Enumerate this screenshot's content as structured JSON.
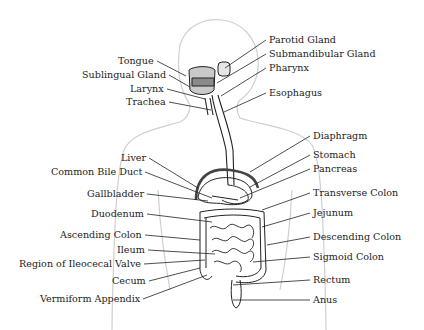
{
  "diagram": {
    "colors": {
      "outline": "#c8c8c8",
      "organ_stroke": "#222222",
      "diaphragm": "#444444",
      "label_text": "#222222",
      "leader": "#222222"
    },
    "labels_left": [
      {
        "id": "tongue",
        "text": "Tongue",
        "x": 118,
        "y": 61,
        "tx": 186,
        "ty": 76
      },
      {
        "id": "sublingual-gland",
        "text": "Sublingual Gland",
        "x": 82,
        "y": 75,
        "tx": 190,
        "ty": 87
      },
      {
        "id": "larynx",
        "text": "Larynx",
        "x": 130,
        "y": 89,
        "tx": 205,
        "ty": 99
      },
      {
        "id": "trachea",
        "text": "Trachea",
        "x": 126,
        "y": 102,
        "tx": 211,
        "ty": 110
      },
      {
        "id": "liver",
        "text": "Liver",
        "x": 121,
        "y": 158,
        "tx": 198,
        "ty": 188
      },
      {
        "id": "common-bile-duct",
        "text": "Common Bile Duct",
        "x": 51,
        "y": 172,
        "tx": 212,
        "ty": 198
      },
      {
        "id": "gallbladder",
        "text": "Gallbladder",
        "x": 87,
        "y": 194,
        "tx": 208,
        "ty": 201
      },
      {
        "id": "duodenum",
        "text": "Duodenum",
        "x": 91,
        "y": 214,
        "tx": 212,
        "ty": 222
      },
      {
        "id": "ascending-colon",
        "text": "Ascending Colon",
        "x": 60,
        "y": 235,
        "tx": 200,
        "ty": 240
      },
      {
        "id": "ileum",
        "text": "Ileum",
        "x": 117,
        "y": 250,
        "tx": 215,
        "ty": 254
      },
      {
        "id": "region-of-ileocecal-valve",
        "text": "Region of Ileocecal Valve",
        "x": 19,
        "y": 264,
        "tx": 205,
        "ty": 260
      },
      {
        "id": "cecum",
        "text": "Cecum",
        "x": 112,
        "y": 281,
        "tx": 200,
        "ty": 268
      },
      {
        "id": "vermiform-appendix",
        "text": "Vermiform Appendix",
        "x": 40,
        "y": 299,
        "tx": 207,
        "ty": 275
      }
    ],
    "labels_right": [
      {
        "id": "parotid-gland",
        "text": "Parotid Gland",
        "x": 269,
        "y": 40,
        "tx": 225,
        "ty": 68
      },
      {
        "id": "submandibular-gland",
        "text": "Submandibular Gland",
        "x": 269,
        "y": 54,
        "tx": 217,
        "ty": 83
      },
      {
        "id": "pharynx",
        "text": "Pharynx",
        "x": 269,
        "y": 68,
        "tx": 221,
        "ty": 96
      },
      {
        "id": "esophagus",
        "text": "Esophagus",
        "x": 269,
        "y": 93,
        "tx": 224,
        "ty": 112
      },
      {
        "id": "diaphragm",
        "text": "Diaphragm",
        "x": 313,
        "y": 136,
        "tx": 250,
        "ty": 172
      },
      {
        "id": "stomach",
        "text": "Stomach",
        "x": 313,
        "y": 155,
        "tx": 250,
        "ty": 187
      },
      {
        "id": "pancreas",
        "text": "Pancreas",
        "x": 313,
        "y": 169,
        "tx": 240,
        "ty": 198
      },
      {
        "id": "transverse-colon",
        "text": "Transverse Colon",
        "x": 313,
        "y": 193,
        "tx": 262,
        "ty": 210
      },
      {
        "id": "jejunum",
        "text": "Jejunum",
        "x": 313,
        "y": 213,
        "tx": 262,
        "ty": 227
      },
      {
        "id": "descending-colon",
        "text": "Descending Colon",
        "x": 313,
        "y": 237,
        "tx": 267,
        "ty": 245
      },
      {
        "id": "sigmoid-colon",
        "text": "Sigmoid Colon",
        "x": 313,
        "y": 257,
        "tx": 253,
        "ty": 262
      },
      {
        "id": "rectum",
        "text": "Rectum",
        "x": 313,
        "y": 280,
        "tx": 233,
        "ty": 285
      },
      {
        "id": "anus",
        "text": "Anus",
        "x": 313,
        "y": 300,
        "tx": 233,
        "ty": 300
      }
    ]
  }
}
